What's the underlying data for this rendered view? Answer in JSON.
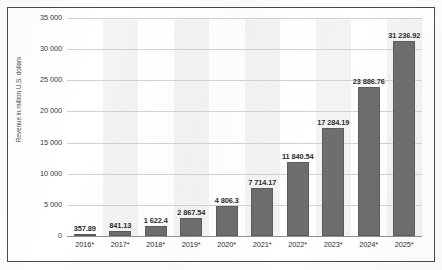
{
  "chart_data": {
    "type": "bar",
    "title": "",
    "subtitle": "",
    "xlabel": "",
    "ylabel": "Revenue in million U.S. dollars",
    "categories": [
      "2016*",
      "2017*",
      "2018*",
      "2019*",
      "2020*",
      "2021*",
      "2022*",
      "2023*",
      "2024*",
      "2025*"
    ],
    "values": [
      357.89,
      841.13,
      1622.4,
      2867.54,
      4806.3,
      7714.17,
      11840.54,
      17284.19,
      23886.76,
      31236.92
    ],
    "data_labels": [
      "357.89",
      "841.13",
      "1 622.4",
      "2 867.54",
      "4 806.3",
      "7 714.17",
      "11 840.54",
      "17 284.19",
      "23 886.76",
      "31 236.92"
    ],
    "ytick_values": [
      0,
      5000,
      10000,
      15000,
      20000,
      25000,
      30000,
      35000
    ],
    "ytick_labels": [
      "0",
      "5 000",
      "10 000",
      "15 000",
      "20 000",
      "25 000",
      "30 000",
      "35 000"
    ],
    "ylim": [
      0,
      35000
    ],
    "grid": true,
    "legend": false,
    "legend_position": "none",
    "series": [
      {
        "name": "Revenue",
        "values": [
          357.89,
          841.13,
          1622.4,
          2867.54,
          4806.3,
          7714.17,
          11840.54,
          17284.19,
          23886.76,
          31236.92
        ]
      }
    ],
    "bar_color": "#6e6e6e",
    "band_color": "#f3f3f3",
    "gridline_color": "#d2d2d2",
    "axis_color": "#8f8f8f"
  },
  "watermark": {
    "text": ""
  }
}
